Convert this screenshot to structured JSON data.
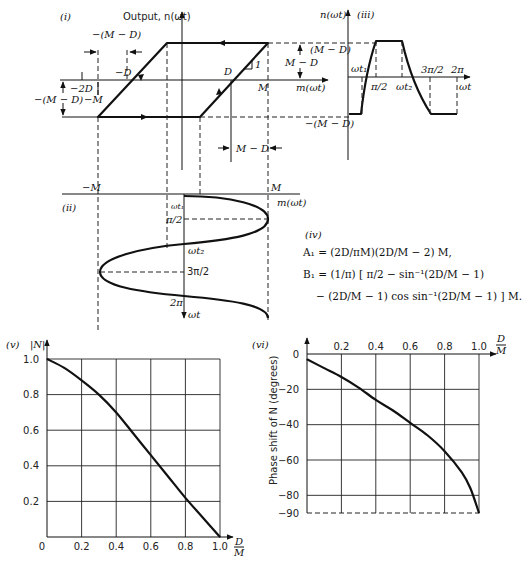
{
  "panel_i": {
    "label": "(i)",
    "y_axis_label": "Output, n(ωt)",
    "x_axis_label": "m(ωt)",
    "labels": {
      "neg_m_minus_d_top": "−(M − D)",
      "neg_d": "−D",
      "neg_2d": "−2D",
      "neg_m_minus_d_left": "−(M − D)",
      "neg_m": "−M",
      "d": "D",
      "slope": "1",
      "m": "M",
      "m_minus_d_right": "M − D",
      "m_minus_d_bottom": "M − D"
    }
  },
  "panel_ii": {
    "label": "(ii)",
    "x_axis_label": "m(ωt)",
    "y_axis_label": "ωt",
    "neg_m": "−M",
    "m": "M",
    "ticks": [
      "ωt₁",
      "π/2",
      "ωt₂",
      "3π/2",
      "2π"
    ]
  },
  "panel_iii": {
    "label": "(iii)",
    "y_axis_label": "n(ωt)",
    "x_axis_label": "ωt",
    "top_level": "(M − D)",
    "bottom_level": "−(M − D)",
    "ticks": [
      "ωt₁",
      "π/2",
      "ωt₂",
      "3π/2",
      "2π"
    ]
  },
  "panel_iv": {
    "label": "(iv)",
    "a1": "A₁ = (2D/πM)(2D/M − 2) M,",
    "b1_line1": "B₁ = (1/π) [ π/2 − sin⁻¹(2D/M − 1)",
    "b1_line2": "− (2D/M − 1) cos sin⁻¹(2D/M − 1) ] M."
  },
  "chart_data": [
    {
      "type": "line",
      "panel": "(v)",
      "title": "",
      "xlabel": "D/M",
      "ylabel": "|N|",
      "xlim": [
        0,
        1.0
      ],
      "ylim": [
        0,
        1.0
      ],
      "grid": true,
      "x_ticks": [
        "0",
        "0.2",
        "0.4",
        "0.6",
        "0.8",
        "1.0"
      ],
      "y_ticks": [
        "0.2",
        "0.4",
        "0.6",
        "0.8",
        "1.0"
      ],
      "x": [
        0,
        0.1,
        0.2,
        0.3,
        0.4,
        0.5,
        0.6,
        0.7,
        0.8,
        0.9,
        1.0
      ],
      "y": [
        1.0,
        0.95,
        0.88,
        0.8,
        0.7,
        0.58,
        0.46,
        0.34,
        0.22,
        0.11,
        0.0
      ]
    },
    {
      "type": "line",
      "panel": "(vi)",
      "title": "",
      "xlabel": "D/M",
      "ylabel": "Phase shift of N (degrees)",
      "xlim": [
        0,
        1.0
      ],
      "ylim": [
        -90,
        0
      ],
      "grid": true,
      "x_ticks": [
        "0.2",
        "0.4",
        "0.6",
        "0.8",
        "1.0"
      ],
      "y_ticks": [
        "0",
        "−20",
        "−40",
        "−60",
        "−80",
        "−90"
      ],
      "x": [
        0,
        0.1,
        0.2,
        0.3,
        0.4,
        0.5,
        0.6,
        0.7,
        0.8,
        0.9,
        0.95,
        1.0
      ],
      "y": [
        -3,
        -8,
        -13,
        -19,
        -26,
        -32,
        -39,
        -46,
        -55,
        -67,
        -76,
        -90
      ]
    }
  ]
}
